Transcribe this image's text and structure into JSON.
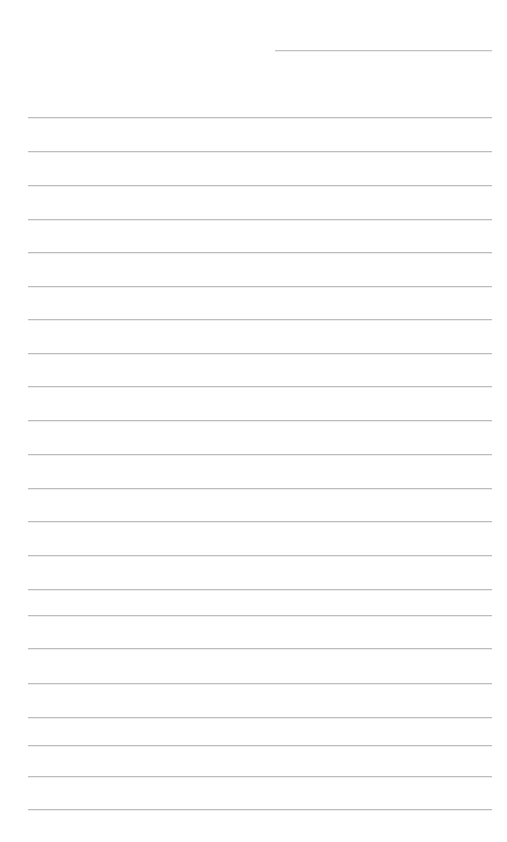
{
  "page": {
    "background_color": "#ffffff",
    "width": 507,
    "height": 842,
    "content_text": "",
    "note": "No text, labels, or controls are rendered on this page."
  },
  "rules": {
    "color_full": "#bdbdbd",
    "color_short": "#c3c3c3",
    "thickness_px": 1,
    "full_left_x": 28,
    "full_right_x": 492,
    "items": [
      {
        "name": "rule-header",
        "x": 275,
        "width": 217,
        "y": 50,
        "kind": "short"
      },
      {
        "name": "rule-1",
        "x": 28,
        "width": 464,
        "y": 117,
        "kind": "full"
      },
      {
        "name": "rule-2",
        "x": 28,
        "width": 464,
        "y": 151,
        "kind": "full"
      },
      {
        "name": "rule-3",
        "x": 28,
        "width": 464,
        "y": 185,
        "kind": "full"
      },
      {
        "name": "rule-4",
        "x": 28,
        "width": 464,
        "y": 219,
        "kind": "full"
      },
      {
        "name": "rule-5",
        "x": 28,
        "width": 464,
        "y": 252,
        "kind": "full"
      },
      {
        "name": "rule-6",
        "x": 28,
        "width": 464,
        "y": 286,
        "kind": "full"
      },
      {
        "name": "rule-7",
        "x": 28,
        "width": 464,
        "y": 319,
        "kind": "full"
      },
      {
        "name": "rule-8",
        "x": 28,
        "width": 464,
        "y": 353,
        "kind": "full"
      },
      {
        "name": "rule-9",
        "x": 28,
        "width": 464,
        "y": 386,
        "kind": "full"
      },
      {
        "name": "rule-10",
        "x": 28,
        "width": 464,
        "y": 420,
        "kind": "full"
      },
      {
        "name": "rule-11",
        "x": 28,
        "width": 464,
        "y": 454,
        "kind": "full"
      },
      {
        "name": "rule-12",
        "x": 28,
        "width": 464,
        "y": 488,
        "kind": "full"
      },
      {
        "name": "rule-13",
        "x": 28,
        "width": 464,
        "y": 521,
        "kind": "full"
      },
      {
        "name": "rule-14",
        "x": 28,
        "width": 464,
        "y": 555,
        "kind": "full"
      },
      {
        "name": "rule-15",
        "x": 28,
        "width": 464,
        "y": 589,
        "kind": "full"
      },
      {
        "name": "rule-16",
        "x": 28,
        "width": 464,
        "y": 615,
        "kind": "full"
      },
      {
        "name": "rule-17",
        "x": 28,
        "width": 464,
        "y": 648,
        "kind": "full"
      },
      {
        "name": "rule-18",
        "x": 28,
        "width": 464,
        "y": 683,
        "kind": "full"
      },
      {
        "name": "rule-19",
        "x": 28,
        "width": 464,
        "y": 717,
        "kind": "full"
      },
      {
        "name": "rule-20",
        "x": 28,
        "width": 464,
        "y": 745,
        "kind": "full"
      },
      {
        "name": "rule-21",
        "x": 28,
        "width": 464,
        "y": 776,
        "kind": "full"
      },
      {
        "name": "rule-22",
        "x": 28,
        "width": 464,
        "y": 809,
        "kind": "full"
      }
    ]
  }
}
